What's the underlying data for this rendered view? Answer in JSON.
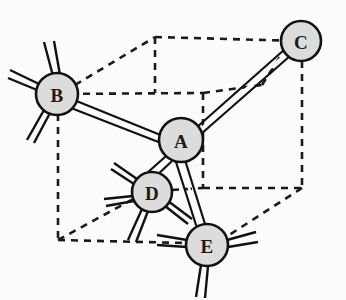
{
  "figure": {
    "type": "diagram",
    "background_color": "#fbfbf9",
    "width": 346,
    "height": 300
  },
  "style": {
    "atom_fill": "#dcdcda",
    "atom_stroke": "#111111",
    "bond_color": "#111111",
    "cell_edge_color": "#1a1a1a",
    "label_color": "#1b1b1b"
  },
  "atoms": [
    {
      "id": "A",
      "label": "A",
      "cx": 181,
      "cy": 140,
      "r": 22
    },
    {
      "id": "B",
      "label": "B",
      "cx": 57,
      "cy": 94,
      "r": 21
    },
    {
      "id": "C",
      "label": "C",
      "cx": 301,
      "cy": 41,
      "r": 20
    },
    {
      "id": "D",
      "label": "D",
      "cx": 152,
      "cy": 192,
      "r": 20
    },
    {
      "id": "E",
      "label": "E",
      "cx": 207,
      "cy": 245,
      "r": 21
    }
  ],
  "bonds": [
    {
      "from": "A",
      "to": "B",
      "style": "double"
    },
    {
      "from": "A",
      "to": "C",
      "style": "double"
    },
    {
      "from": "A",
      "to": "D",
      "style": "double"
    },
    {
      "from": "A",
      "to": "E",
      "style": "double"
    }
  ],
  "dangling_bonds": [
    {
      "atom": "B",
      "count": 4,
      "directions": [
        "up-left",
        "left",
        "left-down",
        "down-left"
      ]
    },
    {
      "atom": "D",
      "count": 4,
      "directions": [
        "up-left",
        "left",
        "down-left",
        "down-right"
      ]
    },
    {
      "atom": "E",
      "count": 3,
      "directions": [
        "left",
        "right",
        "down"
      ]
    }
  ],
  "unit_cell": {
    "shape": "parallelepiped",
    "line_style": "dashed",
    "vertices": {
      "back_top_left": [
        155,
        37
      ],
      "back_top_right": [
        301,
        41
      ],
      "back_bottom_left": [
        155,
        93
      ],
      "back_bottom_right": [
        203,
        93
      ],
      "front_top_left": [
        57,
        94
      ],
      "front_bottom_left": [
        58,
        240
      ],
      "front_bottom_right": [
        203,
        188
      ],
      "right_bottom": [
        302,
        188
      ],
      "bottom_right_front": [
        207,
        245
      ]
    }
  }
}
